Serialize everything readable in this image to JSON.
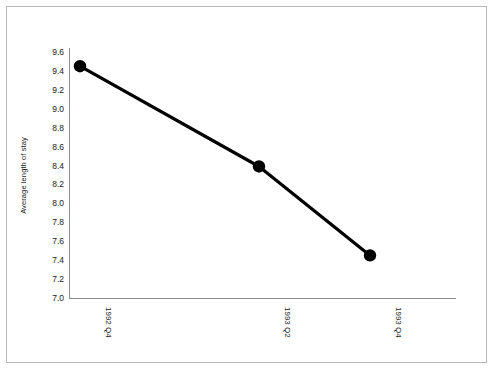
{
  "chart_data": {
    "type": "line",
    "title": "",
    "xlabel": "",
    "ylabel": "Average length of stay",
    "categories": [
      "1992 Q4",
      "1993 Q2",
      "1993 Q4"
    ],
    "values": [
      9.45,
      8.39,
      7.45
    ],
    "series": [
      {
        "name": "Average length of stay",
        "values": [
          9.45,
          8.39,
          7.45
        ]
      }
    ],
    "ylim": [
      7.0,
      9.6
    ],
    "yticks": [
      "7.0",
      "7.2",
      "7.4",
      "7.6",
      "7.8",
      "8.0",
      "8.2",
      "8.4",
      "8.6",
      "8.8",
      "9.0",
      "9.2",
      "9.4",
      "9.6"
    ],
    "ytick_values": [
      7.0,
      7.2,
      7.4,
      7.6,
      7.8,
      8.0,
      8.2,
      8.4,
      8.6,
      8.8,
      9.0,
      9.2,
      9.4,
      9.6
    ],
    "grid": false,
    "legend": false,
    "legend_position": "none",
    "line_color": "#000000",
    "marker_color": "#000000",
    "marker": "circle",
    "axis_color": "#8d8d8d",
    "background_color": "#ffffff",
    "border_color": "#b6b6b6"
  }
}
